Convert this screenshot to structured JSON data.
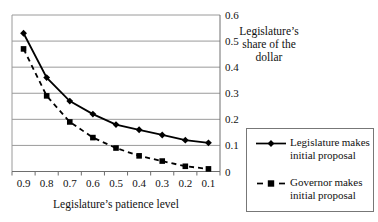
{
  "chart_data": {
    "type": "line",
    "title": "",
    "xlabel": "Legislature’s patience level",
    "ylabel": "Legislature’s share of the dollar",
    "ylabel_lines": [
      "Legislature’s",
      "share of the",
      "dollar"
    ],
    "categories": [
      "0.9",
      "0.8",
      "0.7",
      "0.6",
      "0.5",
      "0.4",
      "0.3",
      "0.2",
      "0.1"
    ],
    "y_ticks": [
      {
        "value": 0.6,
        "label": "0.6"
      },
      {
        "value": 0.5,
        "label": "0.5"
      },
      {
        "value": 0.4,
        "label": "0.4"
      },
      {
        "value": 0.3,
        "label": "0.3"
      },
      {
        "value": 0.2,
        "label": "0.2"
      },
      {
        "value": 0.1,
        "label": "0.1"
      },
      {
        "value": 0.0,
        "label": "0"
      }
    ],
    "ylim": [
      0,
      0.6
    ],
    "grid": "horizontal-only",
    "y_axis_side": "right",
    "legend_position": "outside-right-bottom",
    "series": [
      {
        "name": "Legislature makes initial proposal",
        "values": [
          0.53,
          0.36,
          0.27,
          0.22,
          0.18,
          0.16,
          0.14,
          0.12,
          0.11
        ],
        "line": "solid",
        "marker": "diamond",
        "color": "#000000"
      },
      {
        "name": "Governor makes initial proposal",
        "values": [
          0.47,
          0.29,
          0.19,
          0.13,
          0.09,
          0.06,
          0.04,
          0.02,
          0.01
        ],
        "line": "dashed",
        "marker": "square",
        "color": "#000000"
      }
    ]
  },
  "colors": {
    "background": "#ffffff",
    "gridline": "#9a9a9a",
    "axis": "#6e6e6e",
    "text": "#111111",
    "series": "#000000",
    "legend_border": "#777777"
  }
}
